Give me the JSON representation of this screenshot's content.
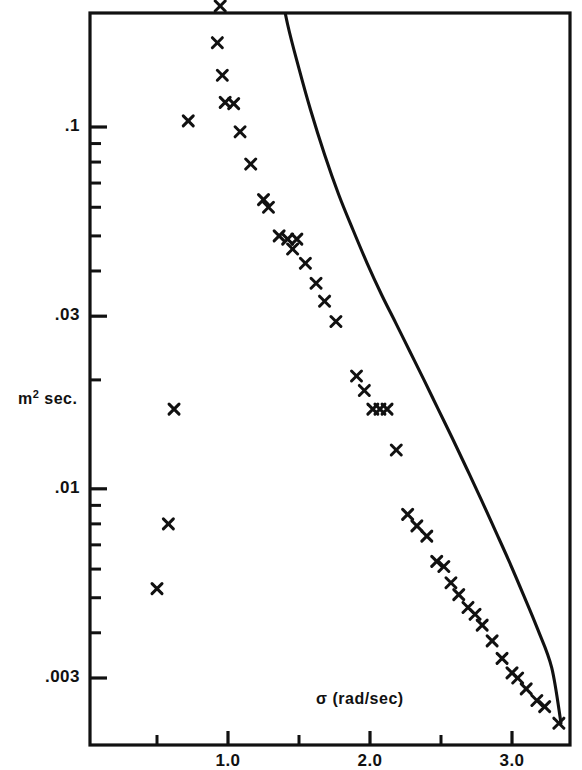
{
  "chart_data": {
    "type": "scatter",
    "title": "",
    "xlabel": "σ (rad/sec)",
    "ylabel": "m² sec.",
    "ylabel_main": "m",
    "ylabel_sup": "2",
    "ylabel_tail": " sec.",
    "xscale": "linear",
    "yscale": "log",
    "xlim": [
      0.38,
      3.78
    ],
    "ylim": [
      0.0021,
      0.26
    ],
    "grid": false,
    "legend": "none",
    "xticks_major": [
      1.0,
      2.0,
      3.0
    ],
    "xticks_major_labels": [
      "1.0",
      "2.0",
      "3.0"
    ],
    "xticks_minor": [
      0.5,
      1.5,
      2.5,
      3.5
    ],
    "yticks_major": [
      0.1,
      0.03,
      0.01,
      0.003
    ],
    "yticks_major_labels": [
      ".1",
      ".03",
      ".01",
      ".003"
    ],
    "yticks_minor": [
      0.09,
      0.08,
      0.07,
      0.06,
      0.05,
      0.04,
      0.02,
      0.009,
      0.008,
      0.007,
      0.006,
      0.005,
      0.004
    ],
    "marker": "x",
    "marker_color": "#111111",
    "line_color": "#111111",
    "series": [
      {
        "name": "measured spectrum",
        "marker": "x",
        "points": [
          {
            "x": 0.845,
            "y": 0.255
          },
          {
            "x": 0.945,
            "y": 0.216
          },
          {
            "x": 0.925,
            "y": 0.171
          },
          {
            "x": 0.96,
            "y": 0.139
          },
          {
            "x": 0.98,
            "y": 0.117
          },
          {
            "x": 1.04,
            "y": 0.116
          },
          {
            "x": 0.72,
            "y": 0.104
          },
          {
            "x": 1.085,
            "y": 0.097
          },
          {
            "x": 1.16,
            "y": 0.079
          },
          {
            "x": 1.25,
            "y": 0.063
          },
          {
            "x": 1.285,
            "y": 0.06
          },
          {
            "x": 1.36,
            "y": 0.05
          },
          {
            "x": 1.42,
            "y": 0.049
          },
          {
            "x": 1.485,
            "y": 0.049
          },
          {
            "x": 1.455,
            "y": 0.046
          },
          {
            "x": 1.545,
            "y": 0.042
          },
          {
            "x": 1.62,
            "y": 0.037
          },
          {
            "x": 1.68,
            "y": 0.033
          },
          {
            "x": 1.76,
            "y": 0.029
          },
          {
            "x": 1.905,
            "y": 0.0205
          },
          {
            "x": 1.96,
            "y": 0.0187
          },
          {
            "x": 2.02,
            "y": 0.0166
          },
          {
            "x": 2.07,
            "y": 0.0166
          },
          {
            "x": 2.12,
            "y": 0.0166
          },
          {
            "x": 2.185,
            "y": 0.0128
          },
          {
            "x": 0.62,
            "y": 0.0166
          },
          {
            "x": 0.58,
            "y": 0.008
          },
          {
            "x": 0.5,
            "y": 0.0053
          },
          {
            "x": 2.265,
            "y": 0.0085
          },
          {
            "x": 2.33,
            "y": 0.0079
          },
          {
            "x": 2.4,
            "y": 0.0074
          },
          {
            "x": 2.47,
            "y": 0.0063
          },
          {
            "x": 2.52,
            "y": 0.0061
          },
          {
            "x": 2.57,
            "y": 0.0055
          },
          {
            "x": 2.625,
            "y": 0.0051
          },
          {
            "x": 2.69,
            "y": 0.0047
          },
          {
            "x": 2.74,
            "y": 0.0045
          },
          {
            "x": 2.79,
            "y": 0.0042
          },
          {
            "x": 2.86,
            "y": 0.0038
          },
          {
            "x": 2.93,
            "y": 0.0034
          },
          {
            "x": 3.0,
            "y": 0.0031
          },
          {
            "x": 3.04,
            "y": 0.003
          },
          {
            "x": 3.1,
            "y": 0.0028
          },
          {
            "x": 3.175,
            "y": 0.0026
          },
          {
            "x": 3.23,
            "y": 0.0025
          },
          {
            "x": 3.33,
            "y": 0.00225
          }
        ]
      }
    ],
    "curve": {
      "name": "theoretical spectrum",
      "points": [
        {
          "x": 1.345,
          "y": 0.27
        },
        {
          "x": 1.42,
          "y": 0.192
        },
        {
          "x": 1.5,
          "y": 0.145
        },
        {
          "x": 1.58,
          "y": 0.112
        },
        {
          "x": 1.68,
          "y": 0.084
        },
        {
          "x": 1.78,
          "y": 0.065
        },
        {
          "x": 1.88,
          "y": 0.052
        },
        {
          "x": 1.98,
          "y": 0.042
        },
        {
          "x": 2.08,
          "y": 0.0345
        },
        {
          "x": 2.18,
          "y": 0.0288
        },
        {
          "x": 2.28,
          "y": 0.024
        },
        {
          "x": 2.38,
          "y": 0.02
        },
        {
          "x": 2.48,
          "y": 0.0166
        },
        {
          "x": 2.58,
          "y": 0.0138
        },
        {
          "x": 2.68,
          "y": 0.0114
        },
        {
          "x": 2.78,
          "y": 0.0094
        },
        {
          "x": 2.88,
          "y": 0.0077
        },
        {
          "x": 2.98,
          "y": 0.0063
        },
        {
          "x": 3.08,
          "y": 0.0051
        },
        {
          "x": 3.18,
          "y": 0.0041
        },
        {
          "x": 3.28,
          "y": 0.0032
        },
        {
          "x": 3.345,
          "y": 0.00225
        }
      ]
    },
    "annotations": [
      {
        "text": "marker above top frame near σ = 0.845",
        "x": 0.845,
        "y": 0.27
      }
    ]
  },
  "axes": {
    "x_title": "σ (rad/sec)",
    "y_title_main": "m",
    "y_title_sup": "2",
    "y_title_tail": " sec.",
    "x_tick_labels": [
      "1.0",
      "2.0",
      "3.0"
    ],
    "y_tick_labels": [
      ".1",
      ".03",
      ".01",
      ".003"
    ]
  },
  "style": {
    "frame_color": "#111111",
    "background": "#ffffff",
    "marker_color": "#111111",
    "curve_color": "#111111"
  }
}
